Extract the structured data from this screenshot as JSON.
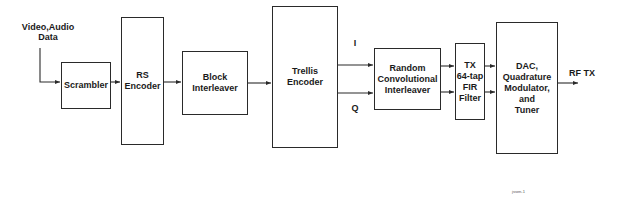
{
  "diagram": {
    "input_label": "Video,Audio\nData",
    "output_label": "RF TX",
    "i_label": "I",
    "q_label": "Q",
    "footnote": "jssen-1",
    "blocks": [
      {
        "id": "scrambler",
        "label": "Scrambler"
      },
      {
        "id": "rs_encoder",
        "label": "RS\nEncoder"
      },
      {
        "id": "block_interleaver",
        "label": "Block\nInterleaver"
      },
      {
        "id": "trellis_encoder",
        "label": "Trellis\nEncoder"
      },
      {
        "id": "random_convolutional_interleaver",
        "label": "Random\nConvolutional\nInterleaver"
      },
      {
        "id": "tx_fir_filter",
        "label": "TX\n64-tap\nFIR\nFilter"
      },
      {
        "id": "dac_modulator_tuner",
        "label": "DAC,\nQuadrature\nModulator,\nand\nTuner"
      }
    ],
    "connections": [
      [
        "input",
        "scrambler"
      ],
      [
        "scrambler",
        "rs_encoder"
      ],
      [
        "rs_encoder",
        "block_interleaver"
      ],
      [
        "block_interleaver",
        "trellis_encoder"
      ],
      [
        "trellis_encoder",
        "random_convolutional_interleaver",
        "I"
      ],
      [
        "trellis_encoder",
        "random_convolutional_interleaver",
        "Q"
      ],
      [
        "random_convolutional_interleaver",
        "tx_fir_filter",
        "I"
      ],
      [
        "random_convolutional_interleaver",
        "tx_fir_filter",
        "Q"
      ],
      [
        "tx_fir_filter",
        "dac_modulator_tuner",
        "I"
      ],
      [
        "tx_fir_filter",
        "dac_modulator_tuner",
        "Q"
      ],
      [
        "dac_modulator_tuner",
        "output"
      ]
    ]
  }
}
